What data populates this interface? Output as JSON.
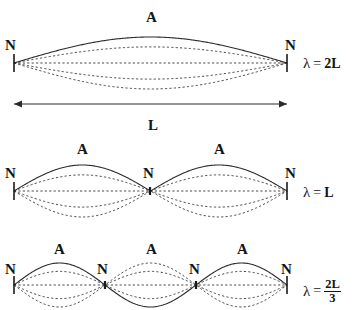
{
  "figure": {
    "title_alt": "Standing waves on a string: first three harmonics",
    "width": 357,
    "height": 310,
    "background_color": "#ffffff",
    "stroke_color": "#333333",
    "text_color": "#141414",
    "solid_stroke_width": 1.1,
    "dashed_stroke_width": 0.9,
    "dash_pattern": "2.2,2.2",
    "string_left_x": 14,
    "string_right_x": 287,
    "node_tick_half_height": 9,
    "envelope_fractions": [
      1.0,
      0.62,
      0.0,
      -0.62,
      -1.0
    ],
    "solid_fraction_index": 0
  },
  "length_arrow": {
    "label": "L",
    "label_x": 148,
    "label_y": 118,
    "y": 104,
    "x_start": 14,
    "x_end": 287,
    "arrow_head_size": 6
  },
  "harmonics": [
    {
      "id": "harmonic-1",
      "name": "fundamental",
      "axis_y": 63,
      "amplitude": 26,
      "loops": 1,
      "loop_phase": [
        1
      ],
      "nodes": [
        {
          "label": "N",
          "x": 14,
          "label_x": 5,
          "label_y": 38
        },
        {
          "label": "N",
          "x": 287,
          "label_x": 285,
          "label_y": 38
        }
      ],
      "antinodes": [
        {
          "label": "A",
          "x": 150,
          "label_x": 146,
          "label_y": 10
        }
      ],
      "wavelength": {
        "lambda": "λ",
        "equals": "=",
        "value": "2L",
        "is_fraction": false,
        "numerator": "",
        "denominator": "",
        "x": 303,
        "y": 56
      }
    },
    {
      "id": "harmonic-2",
      "name": "second-harmonic",
      "axis_y": 191,
      "amplitude": 26,
      "loops": 2,
      "loop_phase": [
        1,
        1
      ],
      "nodes": [
        {
          "label": "N",
          "x": 14,
          "label_x": 5,
          "label_y": 166
        },
        {
          "label": "N",
          "x": 150,
          "label_x": 143,
          "label_y": 166
        },
        {
          "label": "N",
          "x": 287,
          "label_x": 285,
          "label_y": 166
        }
      ],
      "antinodes": [
        {
          "label": "A",
          "x": 82,
          "label_x": 77,
          "label_y": 142
        },
        {
          "label": "A",
          "x": 218,
          "label_x": 214,
          "label_y": 142
        }
      ],
      "wavelength": {
        "lambda": "λ",
        "equals": "=",
        "value": "L",
        "is_fraction": false,
        "numerator": "",
        "denominator": "",
        "x": 303,
        "y": 185
      }
    },
    {
      "id": "harmonic-3",
      "name": "third-harmonic",
      "axis_y": 285,
      "amplitude": 22,
      "loops": 3,
      "loop_phase": [
        1,
        -1,
        1
      ],
      "nodes": [
        {
          "label": "N",
          "x": 14,
          "label_x": 5,
          "label_y": 262
        },
        {
          "label": "N",
          "x": 105,
          "label_x": 97,
          "label_y": 262
        },
        {
          "label": "N",
          "x": 196,
          "label_x": 189,
          "label_y": 262
        },
        {
          "label": "N",
          "x": 287,
          "label_x": 281,
          "label_y": 262
        }
      ],
      "antinodes": [
        {
          "label": "A",
          "x": 60,
          "label_x": 54,
          "label_y": 242
        },
        {
          "label": "A",
          "x": 150,
          "label_x": 146,
          "label_y": 242
        },
        {
          "label": "A",
          "x": 241,
          "label_x": 237,
          "label_y": 242
        }
      ],
      "wavelength": {
        "lambda": "λ",
        "equals": "=",
        "value": "2L/3",
        "is_fraction": true,
        "numerator": "2L",
        "denominator": "3",
        "x": 303,
        "y": 278
      }
    }
  ]
}
